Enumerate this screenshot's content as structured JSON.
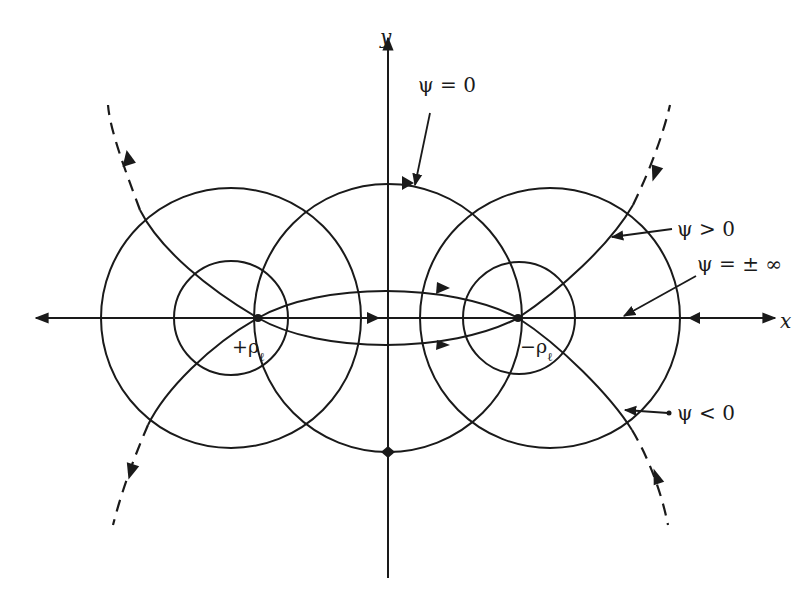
{
  "figure": {
    "background": "#ffffff",
    "stroke_color": "#1a1a1a"
  },
  "axes": {
    "x_label": "x",
    "y_label": "y"
  },
  "charges": [
    {
      "id": "positive",
      "label": "+ρ",
      "subscript": "ℓ",
      "x": 258,
      "y": 318
    },
    {
      "id": "negative",
      "label": "−ρ",
      "subscript": "ℓ",
      "x": 518,
      "y": 318
    }
  ],
  "annotations": {
    "psi_zero": "ψ = 0",
    "psi_positive": "ψ > 0",
    "psi_infinity": "ψ = ± ∞",
    "psi_negative": "ψ < 0"
  }
}
